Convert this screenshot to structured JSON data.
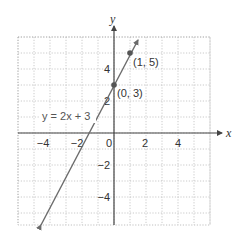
{
  "chart_data": {
    "type": "line",
    "title": "",
    "xlabel": "x",
    "ylabel": "y",
    "xlim": [
      -6,
      6
    ],
    "ylim": [
      -6,
      6
    ],
    "grid": true,
    "x_ticks": [
      -4,
      -2,
      0,
      2,
      4
    ],
    "y_ticks": [
      -4,
      -2,
      2,
      4
    ],
    "x_tick_labels": [
      "−4",
      "−2",
      "0",
      "2",
      "4"
    ],
    "y_tick_labels": [
      "−4",
      "−2",
      "2",
      "4"
    ],
    "series": [
      {
        "name": "y = 2x + 3",
        "equation": "y = 2x + 3",
        "slope": 2,
        "intercept": 3,
        "x": [
          -4.6,
          1.5
        ],
        "values": [
          -6.2,
          6.0
        ],
        "color": "#666666"
      }
    ],
    "points": [
      {
        "x": 0,
        "y": 3,
        "label": "(0, 3)"
      },
      {
        "x": 1,
        "y": 5,
        "label": "(1, 5)"
      }
    ],
    "annotations": [
      {
        "text": "y = 2x + 3",
        "x": -4,
        "y": 1.5
      }
    ]
  },
  "labels": {
    "x_axis": "x",
    "y_axis": "y",
    "equation": "y = 2x + 3",
    "point_a": "(0, 3)",
    "point_b": "(1, 5)",
    "tick_x_m4": "−4",
    "tick_x_m2": "−2",
    "tick_origin": "0",
    "tick_x_2": "2",
    "tick_x_4": "4",
    "tick_y_4": "4",
    "tick_y_2": "2",
    "tick_y_m2": "−2",
    "tick_y_m4": "−4"
  },
  "colors": {
    "axis": "#555555",
    "grid": "#b8b8b8",
    "line": "#6b6b6b",
    "point": "#555555"
  }
}
